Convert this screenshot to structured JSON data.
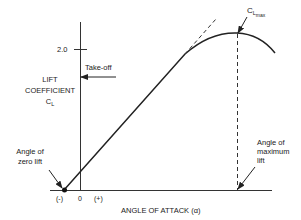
{
  "diagram": {
    "y_axis": {
      "label_line1": "LIFT",
      "label_line2": "COEFFICIENT",
      "label_symbol": "C",
      "label_symbol_sub": "L",
      "tick_label": "2.0"
    },
    "x_axis": {
      "label": "ANGLE OF ATTACK (α)",
      "tick_neg": "(-)",
      "tick_zero": "0",
      "tick_pos": "(+)"
    },
    "annotations": {
      "takeoff": "Take-off",
      "clmax_symbol": "C",
      "clmax_sub1": "L",
      "clmax_sub2": "max",
      "zero_lift_line1": "Angle of",
      "zero_lift_line2": "zero lift",
      "max_lift_line1": "Angle of",
      "max_lift_line2": "maximum",
      "max_lift_line3": "lift"
    },
    "colors": {
      "line": "#222222",
      "background": "#ffffff"
    }
  }
}
